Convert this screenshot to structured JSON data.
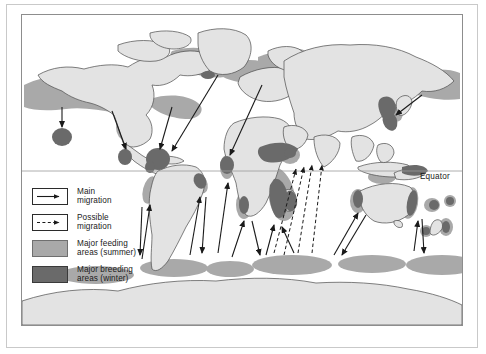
{
  "figure": {
    "type": "thematic-map",
    "equator_label": "Equator"
  },
  "legend": {
    "items": [
      {
        "symbol": "solid-arrow",
        "label": "Main\nmigration"
      },
      {
        "symbol": "dashed-arrow",
        "label": "Possible\nmigration"
      },
      {
        "symbol": "gray-swatch",
        "label": "Major feeding\nareas (summer)"
      },
      {
        "symbol": "dark-swatch",
        "label": "Major breeding\nareas (winter)"
      }
    ]
  },
  "colors": {
    "land": "#e3e3e3",
    "land_outline": "#4a4a4a",
    "feeding_area": "#a9a9a9",
    "breeding_area": "#6a6a6a",
    "arrow": "#1a1a1a",
    "frame": "#8d8d8d",
    "outer_frame": "#c9c9c9",
    "equator_line": "#9a9a9a",
    "background": "#ffffff",
    "text": "#1a1a1a"
  },
  "map": {
    "equator_y_fraction": 0.505,
    "feeding_zones_count": 24,
    "breeding_zones_count": 17,
    "main_arrows_count": 19,
    "possible_arrows_count": 4,
    "antarctic_feeding_bands": 6
  }
}
